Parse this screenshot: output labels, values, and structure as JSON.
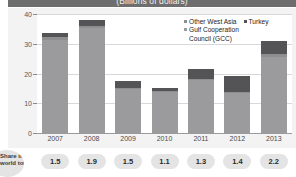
{
  "chart_data": {
    "type": "bar",
    "title": "(Billions of dollars)",
    "xlabel": "",
    "ylabel": "",
    "ylim": [
      0,
      40
    ],
    "yticks": [
      0,
      10,
      20,
      30,
      40
    ],
    "grid": true,
    "stacked": true,
    "legend_position": "top-right",
    "categories": [
      "2007",
      "2008",
      "2009",
      "2010",
      "2011",
      "2012",
      "2013"
    ],
    "series": [
      {
        "name": "Gulf Cooperation Council (GCC)",
        "color": "#9b9b9d",
        "values": [
          31.3,
          35.4,
          14.7,
          13.8,
          17.7,
          13.4,
          25.7
        ]
      },
      {
        "name": "Other West Asia",
        "color": "#8e8e90",
        "values": [
          0.9,
          0.7,
          0.5,
          0.4,
          0.6,
          0.5,
          0.8
        ]
      },
      {
        "name": "Turkey",
        "color": "#545456",
        "values": [
          1.5,
          1.9,
          2.3,
          1.1,
          3.1,
          5.1,
          4.4
        ]
      }
    ],
    "totals": [
      33.7,
      38.0,
      17.5,
      15.3,
      21.4,
      19.0,
      30.9
    ],
    "annotations": {
      "row_label": "Share in world total",
      "row_values": [
        "1.5",
        "1.9",
        "1.5",
        "1.1",
        "1.3",
        "1.4",
        "2.2"
      ]
    }
  },
  "legend": {
    "other_west_asia": "Other West Asia",
    "turkey": "Turkey",
    "gcc_line1": "Gulf Cooperation",
    "gcc_line2": "Council (GCC)"
  }
}
